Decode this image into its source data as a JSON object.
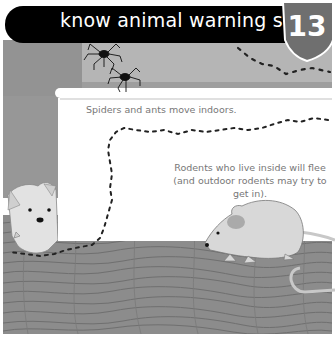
{
  "header": {
    "title": "know animal warning signs",
    "page_number": "13"
  },
  "captions": {
    "spiders_ants": "Spiders and ants move indoors.",
    "rodents": "Rodents who live inside will flee (and outdoor rodents may try to get in)."
  },
  "illustration": {
    "elements": [
      "spider-1",
      "spider-2",
      "ant-trail",
      "dog",
      "mouse",
      "wood-floor"
    ]
  },
  "colors": {
    "header_bg": "#000000",
    "badge_bg": "#6f6f6f",
    "wall": "#9a9a9a",
    "caption_text": "#777777"
  }
}
